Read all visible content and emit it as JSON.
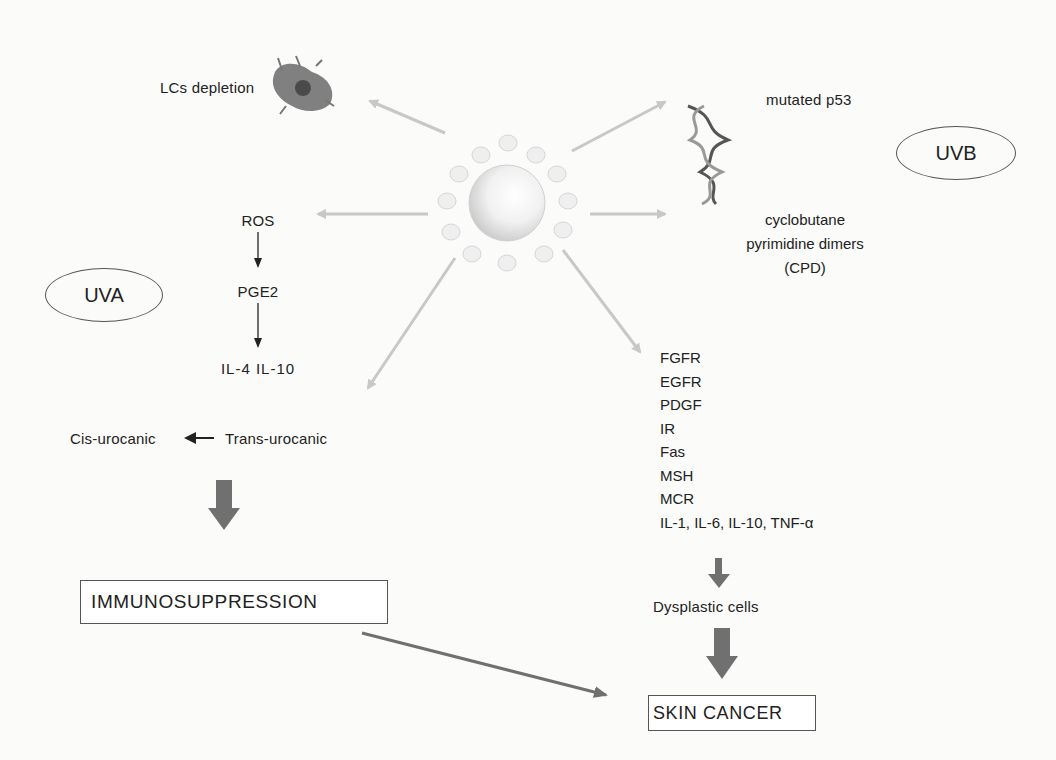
{
  "diagram": {
    "center": {
      "label": "sun",
      "icon": "sun-icon"
    },
    "uvb": {
      "label": "UVB",
      "lcs": {
        "label": "LCs depletion",
        "icon": "langerhans-cell-icon"
      },
      "p53": {
        "label": "mutated p53",
        "icon": "dna-helix-icon"
      },
      "cpd": {
        "line1": "cyclobutane",
        "line2": "pyrimidine dimers",
        "line3": "(CPD)"
      }
    },
    "uva": {
      "label": "UVA",
      "pathway": [
        "ROS",
        "PGE2",
        "IL-4 IL-10"
      ],
      "urocanic": {
        "cis": "Cis-urocanic",
        "trans": "Trans-urocanic"
      }
    },
    "receptors": [
      "FGFR",
      "EGFR",
      "PDGF",
      "IR",
      "Fas",
      "MSH",
      "MCR",
      "IL-1, IL-6, IL-10, TNF-α"
    ],
    "dysplastic": "Dysplastic cells",
    "immunosuppression": "IMMUNOSUPPRESSION",
    "skin_cancer": "SKIN CANCER",
    "colors": {
      "light_arrow": "#c8c8c8",
      "thick_arrow": "#707070",
      "text": "#222222",
      "border": "#555555"
    }
  }
}
